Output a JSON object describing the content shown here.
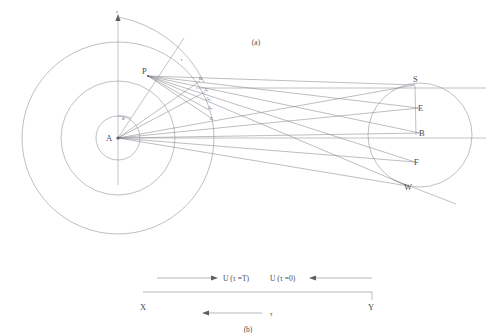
{
  "figure": {
    "panel_a_label": "(a)",
    "panel_b_label": "(b)",
    "colors": {
      "line": "#8c8c92",
      "ray": "#7c7c84",
      "text": "#4a4a50",
      "background": "#ffffff"
    }
  },
  "panel_a": {
    "center_label": "A",
    "angle_label": "θ",
    "axis_top_label": "z",
    "arc_label": "r",
    "source_point_label": "P",
    "scatter_points": [
      {
        "label": "D",
        "x": 200,
        "y": 81
      },
      {
        "label": "A₁",
        "x": 205,
        "y": 92
      },
      {
        "label": "A₂",
        "x": 207,
        "y": 101
      },
      {
        "label": "A₃",
        "x": 209,
        "y": 110
      },
      {
        "label": "G",
        "x": 211,
        "y": 118
      }
    ],
    "circle_radii_labels": [
      "r₁",
      "r₂",
      "r₃"
    ],
    "target_points": [
      {
        "label": "S",
        "x": 415,
        "y": 85
      },
      {
        "label": "E",
        "x": 419,
        "y": 108
      },
      {
        "label": "B",
        "x": 420,
        "y": 133
      },
      {
        "label": "F",
        "x": 415,
        "y": 162
      },
      {
        "label": "W",
        "x": 408,
        "y": 186
      }
    ]
  },
  "panel_b": {
    "flow_left_label": "U (τ =T)",
    "flow_right_label": "U (τ =0)",
    "baseline_left_label": "X",
    "baseline_right_label": "Y",
    "tau_label": "τ"
  }
}
